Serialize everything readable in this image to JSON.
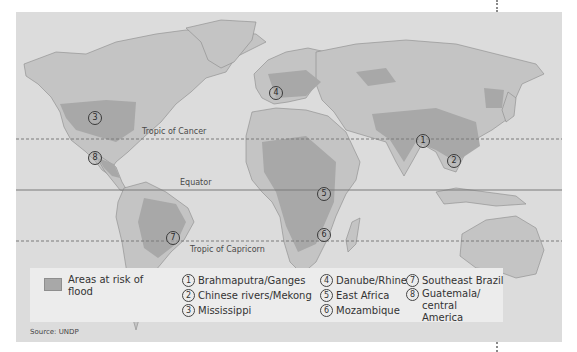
{
  "map": {
    "source": "Source: UNDP",
    "colors": {
      "ocean": "#dcdcdc",
      "land": "#c4c4c4",
      "flood_risk": "#a8a8a8",
      "border": "#8a8a8a",
      "legend_bg": "#ececec"
    },
    "lines": [
      {
        "label": "Tropic of Cancer",
        "style": "dashed"
      },
      {
        "label": "Equator",
        "style": "solid"
      },
      {
        "label": "Tropic of Capricorn",
        "style": "dashed"
      }
    ],
    "markers": [
      {
        "num": "1",
        "region": "Brahmaputra/Ganges"
      },
      {
        "num": "2",
        "region": "Chinese rivers/Mekong"
      },
      {
        "num": "3",
        "region": "Mississippi"
      },
      {
        "num": "4",
        "region": "Danube/Rhine"
      },
      {
        "num": "5",
        "region": "East Africa"
      },
      {
        "num": "6",
        "region": "Mozambique"
      },
      {
        "num": "7",
        "region": "Southeast Brazil"
      },
      {
        "num": "8",
        "region": "Guatemala/central America"
      }
    ]
  },
  "legend": {
    "key_label": "Areas at risk of flood",
    "items": [
      {
        "num": "1",
        "label": "Brahmaputra/Ganges"
      },
      {
        "num": "2",
        "label": "Chinese rivers/Mekong"
      },
      {
        "num": "3",
        "label": "Mississippi"
      },
      {
        "num": "4",
        "label": "Danube/Rhine"
      },
      {
        "num": "5",
        "label": "East Africa"
      },
      {
        "num": "6",
        "label": "Mozambique"
      },
      {
        "num": "7",
        "label": "Southeast Brazil"
      },
      {
        "num": "8",
        "label": "Guatemala/ central America"
      }
    ]
  }
}
